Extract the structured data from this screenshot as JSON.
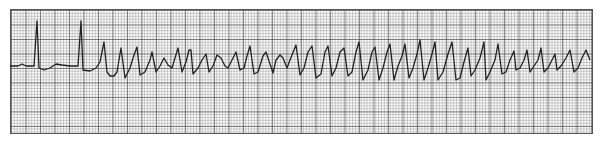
{
  "chart_data": {
    "type": "line",
    "title": "",
    "xlabel": "",
    "ylabel": "",
    "grid": true,
    "trace_color": "#222222",
    "points": [
      [
        10,
        66
      ],
      [
        18,
        66
      ],
      [
        22,
        64
      ],
      [
        26,
        66
      ],
      [
        34,
        66
      ],
      [
        37,
        21
      ],
      [
        39,
        68
      ],
      [
        44,
        70
      ],
      [
        50,
        68
      ],
      [
        56,
        64
      ],
      [
        62,
        65
      ],
      [
        70,
        66
      ],
      [
        78,
        66
      ],
      [
        81,
        21
      ],
      [
        83,
        70
      ],
      [
        90,
        71
      ],
      [
        96,
        68
      ],
      [
        100,
        62
      ],
      [
        104,
        42
      ],
      [
        107,
        72
      ],
      [
        110,
        76
      ],
      [
        114,
        76
      ],
      [
        117,
        72
      ],
      [
        121,
        48
      ],
      [
        125,
        78
      ],
      [
        130,
        68
      ],
      [
        134,
        55
      ],
      [
        137,
        47
      ],
      [
        140,
        75
      ],
      [
        145,
        72
      ],
      [
        150,
        60
      ],
      [
        152,
        52
      ],
      [
        156,
        72
      ],
      [
        160,
        66
      ],
      [
        164,
        58
      ],
      [
        168,
        65
      ],
      [
        172,
        68
      ],
      [
        175,
        58
      ],
      [
        178,
        48
      ],
      [
        182,
        72
      ],
      [
        186,
        62
      ],
      [
        189,
        50
      ],
      [
        191,
        50
      ],
      [
        193,
        74
      ],
      [
        198,
        68
      ],
      [
        202,
        60
      ],
      [
        206,
        54
      ],
      [
        209,
        72
      ],
      [
        213,
        66
      ],
      [
        217,
        55
      ],
      [
        221,
        58
      ],
      [
        225,
        66
      ],
      [
        228,
        68
      ],
      [
        232,
        60
      ],
      [
        236,
        52
      ],
      [
        240,
        70
      ],
      [
        244,
        68
      ],
      [
        247,
        56
      ],
      [
        250,
        46
      ],
      [
        254,
        74
      ],
      [
        258,
        72
      ],
      [
        263,
        56
      ],
      [
        266,
        52
      ],
      [
        270,
        64
      ],
      [
        273,
        73
      ],
      [
        276,
        60
      ],
      [
        280,
        55
      ],
      [
        283,
        58
      ],
      [
        287,
        68
      ],
      [
        290,
        60
      ],
      [
        296,
        45
      ],
      [
        300,
        75
      ],
      [
        304,
        68
      ],
      [
        308,
        52
      ],
      [
        312,
        46
      ],
      [
        316,
        78
      ],
      [
        321,
        74
      ],
      [
        325,
        52
      ],
      [
        328,
        46
      ],
      [
        332,
        76
      ],
      [
        336,
        68
      ],
      [
        340,
        52
      ],
      [
        344,
        48
      ],
      [
        348,
        76
      ],
      [
        352,
        72
      ],
      [
        356,
        52
      ],
      [
        359,
        42
      ],
      [
        363,
        80
      ],
      [
        368,
        70
      ],
      [
        372,
        52
      ],
      [
        375,
        47
      ],
      [
        379,
        80
      ],
      [
        383,
        68
      ],
      [
        387,
        52
      ],
      [
        390,
        44
      ],
      [
        394,
        80
      ],
      [
        398,
        66
      ],
      [
        402,
        56
      ],
      [
        405,
        44
      ],
      [
        409,
        78
      ],
      [
        413,
        68
      ],
      [
        417,
        54
      ],
      [
        420,
        40
      ],
      [
        424,
        80
      ],
      [
        428,
        68
      ],
      [
        432,
        54
      ],
      [
        435,
        42
      ],
      [
        438,
        80
      ],
      [
        443,
        72
      ],
      [
        448,
        54
      ],
      [
        452,
        42
      ],
      [
        456,
        80
      ],
      [
        460,
        78
      ],
      [
        464,
        62
      ],
      [
        468,
        48
      ],
      [
        471,
        76
      ],
      [
        475,
        70
      ],
      [
        480,
        58
      ],
      [
        484,
        42
      ],
      [
        486,
        80
      ],
      [
        490,
        72
      ],
      [
        495,
        60
      ],
      [
        498,
        44
      ],
      [
        502,
        74
      ],
      [
        506,
        72
      ],
      [
        510,
        60
      ],
      [
        514,
        51
      ],
      [
        516,
        70
      ],
      [
        520,
        68
      ],
      [
        524,
        60
      ],
      [
        527,
        50
      ],
      [
        530,
        72
      ],
      [
        534,
        66
      ],
      [
        538,
        60
      ],
      [
        541,
        48
      ],
      [
        544,
        72
      ],
      [
        548,
        68
      ],
      [
        552,
        60
      ],
      [
        555,
        54
      ],
      [
        557,
        70
      ],
      [
        561,
        66
      ],
      [
        566,
        58
      ],
      [
        570,
        50
      ],
      [
        574,
        72
      ],
      [
        578,
        68
      ],
      [
        582,
        58
      ],
      [
        586,
        50
      ],
      [
        590,
        60
      ]
    ]
  }
}
